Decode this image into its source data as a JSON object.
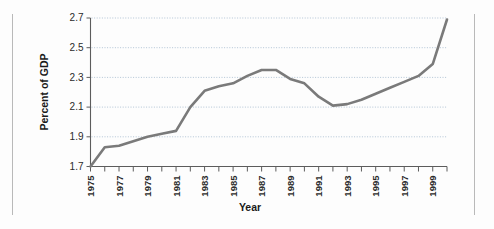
{
  "chart_data": {
    "type": "line",
    "title": "",
    "xlabel": "Year",
    "ylabel": "Percent of GDP",
    "xlim": [
      1975,
      2000
    ],
    "ylim": [
      1.7,
      2.7
    ],
    "grid": true,
    "legend": "none",
    "y_ticks": [
      "1.7",
      "1.9",
      "2.1",
      "2.3",
      "2.5",
      "2.7"
    ],
    "y_tick_values": [
      1.7,
      1.9,
      2.1,
      2.3,
      2.5,
      2.7
    ],
    "x_ticks": [
      "1975",
      "1977",
      "1979",
      "1981",
      "1983",
      "1985",
      "1987",
      "1989",
      "1991",
      "1993",
      "1995",
      "1997",
      "1999"
    ],
    "x_tick_values": [
      1975,
      1977,
      1979,
      1981,
      1983,
      1985,
      1987,
      1989,
      1991,
      1993,
      1995,
      1997,
      1999
    ],
    "series": [
      {
        "name": "Percent of GDP",
        "color": "#7a7a7a",
        "x": [
          1975,
          1976,
          1977,
          1978,
          1979,
          1980,
          1981,
          1982,
          1983,
          1984,
          1985,
          1986,
          1987,
          1988,
          1989,
          1990,
          1991,
          1992,
          1993,
          1994,
          1995,
          1996,
          1997,
          1998,
          1999,
          2000
        ],
        "values": [
          1.7,
          1.83,
          1.84,
          1.87,
          1.9,
          1.92,
          1.94,
          2.1,
          2.21,
          2.24,
          2.26,
          2.31,
          2.35,
          2.35,
          2.29,
          2.26,
          2.17,
          2.11,
          2.12,
          2.15,
          2.19,
          2.23,
          2.27,
          2.31,
          2.39,
          2.69
        ]
      }
    ]
  },
  "labels": {
    "x_axis_title": "Year",
    "y_axis_title": "Percent of GDP"
  }
}
